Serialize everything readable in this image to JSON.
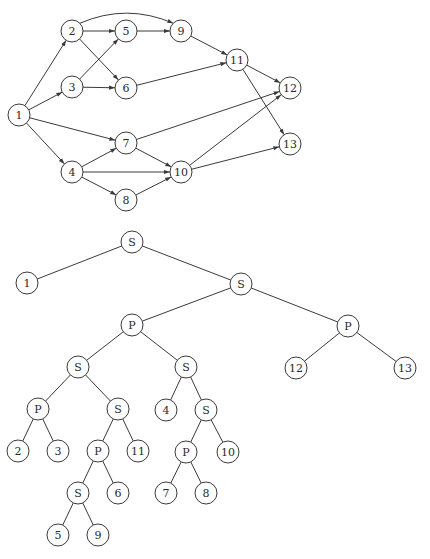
{
  "dag": {
    "nodes": [
      {
        "id": "1",
        "label": "1",
        "x": 19,
        "y": 115
      },
      {
        "id": "2",
        "label": "2",
        "x": 72,
        "y": 31
      },
      {
        "id": "3",
        "label": "3",
        "x": 72,
        "y": 87
      },
      {
        "id": "4",
        "label": "4",
        "x": 72,
        "y": 172
      },
      {
        "id": "5",
        "label": "5",
        "x": 126,
        "y": 31
      },
      {
        "id": "6",
        "label": "6",
        "x": 126,
        "y": 88
      },
      {
        "id": "7",
        "label": "7",
        "x": 126,
        "y": 143
      },
      {
        "id": "8",
        "label": "8",
        "x": 126,
        "y": 200
      },
      {
        "id": "9",
        "label": "9",
        "x": 181,
        "y": 31
      },
      {
        "id": "10",
        "label": "10",
        "x": 181,
        "y": 172
      },
      {
        "id": "11",
        "label": "11",
        "x": 237,
        "y": 60
      },
      {
        "id": "12",
        "label": "12",
        "x": 290,
        "y": 88
      },
      {
        "id": "13",
        "label": "13",
        "x": 290,
        "y": 144
      }
    ],
    "edges": [
      {
        "from": "1",
        "to": "2"
      },
      {
        "from": "1",
        "to": "3"
      },
      {
        "from": "1",
        "to": "7"
      },
      {
        "from": "1",
        "to": "4"
      },
      {
        "from": "2",
        "to": "5"
      },
      {
        "from": "2",
        "to": "6"
      },
      {
        "from": "2",
        "to": "9",
        "curved": true
      },
      {
        "from": "3",
        "to": "5"
      },
      {
        "from": "3",
        "to": "6"
      },
      {
        "from": "4",
        "to": "7"
      },
      {
        "from": "4",
        "to": "10"
      },
      {
        "from": "4",
        "to": "8"
      },
      {
        "from": "5",
        "to": "9"
      },
      {
        "from": "6",
        "to": "11"
      },
      {
        "from": "7",
        "to": "10"
      },
      {
        "from": "7",
        "to": "12"
      },
      {
        "from": "8",
        "to": "10"
      },
      {
        "from": "9",
        "to": "11"
      },
      {
        "from": "10",
        "to": "12"
      },
      {
        "from": "10",
        "to": "13"
      },
      {
        "from": "11",
        "to": "12"
      },
      {
        "from": "11",
        "to": "13"
      }
    ]
  },
  "tree": {
    "nodes": [
      {
        "id": "t0",
        "label": "S",
        "x": 132,
        "y": 242
      },
      {
        "id": "t1",
        "label": "1",
        "x": 27,
        "y": 283
      },
      {
        "id": "t2",
        "label": "S",
        "x": 241,
        "y": 284
      },
      {
        "id": "t3",
        "label": "P",
        "x": 132,
        "y": 325
      },
      {
        "id": "t4",
        "label": "P",
        "x": 348,
        "y": 326
      },
      {
        "id": "t5",
        "label": "12",
        "x": 296,
        "y": 368
      },
      {
        "id": "t6",
        "label": "13",
        "x": 405,
        "y": 368
      },
      {
        "id": "t7",
        "label": "S",
        "x": 78,
        "y": 367
      },
      {
        "id": "t8",
        "label": "S",
        "x": 186,
        "y": 367
      },
      {
        "id": "t9",
        "label": "P",
        "x": 38,
        "y": 409
      },
      {
        "id": "t10",
        "label": "S",
        "x": 118,
        "y": 409
      },
      {
        "id": "t11",
        "label": "4",
        "x": 166,
        "y": 410
      },
      {
        "id": "t12",
        "label": "S",
        "x": 206,
        "y": 410
      },
      {
        "id": "t13",
        "label": "2",
        "x": 18,
        "y": 451
      },
      {
        "id": "t14",
        "label": "3",
        "x": 58,
        "y": 451
      },
      {
        "id": "t15",
        "label": "P",
        "x": 98,
        "y": 451
      },
      {
        "id": "t16",
        "label": "11",
        "x": 138,
        "y": 451
      },
      {
        "id": "t17",
        "label": "P",
        "x": 186,
        "y": 452
      },
      {
        "id": "t18",
        "label": "10",
        "x": 228,
        "y": 452
      },
      {
        "id": "t19",
        "label": "S",
        "x": 78,
        "y": 493
      },
      {
        "id": "t20",
        "label": "6",
        "x": 118,
        "y": 493
      },
      {
        "id": "t21",
        "label": "7",
        "x": 166,
        "y": 493
      },
      {
        "id": "t22",
        "label": "8",
        "x": 206,
        "y": 493
      },
      {
        "id": "t23",
        "label": "5",
        "x": 58,
        "y": 535
      },
      {
        "id": "t24",
        "label": "9",
        "x": 98,
        "y": 535
      }
    ],
    "edges": [
      {
        "from": "t0",
        "to": "t1"
      },
      {
        "from": "t0",
        "to": "t2"
      },
      {
        "from": "t2",
        "to": "t3"
      },
      {
        "from": "t2",
        "to": "t4"
      },
      {
        "from": "t4",
        "to": "t5"
      },
      {
        "from": "t4",
        "to": "t6"
      },
      {
        "from": "t3",
        "to": "t7"
      },
      {
        "from": "t3",
        "to": "t8"
      },
      {
        "from": "t7",
        "to": "t9"
      },
      {
        "from": "t7",
        "to": "t10"
      },
      {
        "from": "t8",
        "to": "t11"
      },
      {
        "from": "t8",
        "to": "t12"
      },
      {
        "from": "t9",
        "to": "t13"
      },
      {
        "from": "t9",
        "to": "t14"
      },
      {
        "from": "t10",
        "to": "t15"
      },
      {
        "from": "t10",
        "to": "t16"
      },
      {
        "from": "t12",
        "to": "t17"
      },
      {
        "from": "t12",
        "to": "t18"
      },
      {
        "from": "t15",
        "to": "t19"
      },
      {
        "from": "t15",
        "to": "t20"
      },
      {
        "from": "t17",
        "to": "t21"
      },
      {
        "from": "t17",
        "to": "t22"
      },
      {
        "from": "t19",
        "to": "t23"
      },
      {
        "from": "t19",
        "to": "t24"
      }
    ]
  },
  "style": {
    "node_radius": 11,
    "stroke_color": "#3a3a3a"
  }
}
